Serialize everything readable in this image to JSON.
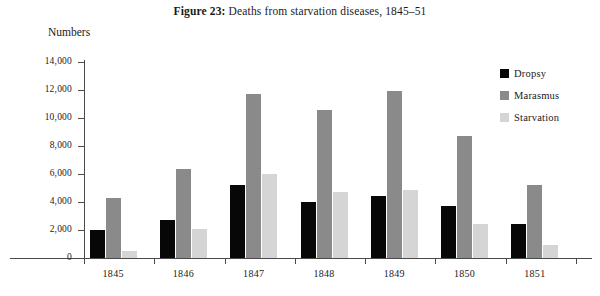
{
  "title": {
    "figure_label": "Figure 23:",
    "figure_text": "Deaths from starvation diseases, 1845–51"
  },
  "axis": {
    "y_title": "Numbers"
  },
  "legend": {
    "position": "right",
    "items": [
      {
        "label": "Dropsy",
        "color": "#070707"
      },
      {
        "label": "Marasmus",
        "color": "#8a8a8a"
      },
      {
        "label": "Starvation",
        "color": "#d5d5d5"
      }
    ]
  },
  "chart_data": {
    "type": "bar",
    "title": "Figure 23: Deaths from starvation diseases, 1845–51",
    "xlabel": "",
    "ylabel": "Numbers",
    "ylim": [
      0,
      14000
    ],
    "ytick_labels": [
      "14,000",
      "12,000",
      "10,000",
      "8,000",
      "6,000",
      "4,000",
      "2,000",
      "0"
    ],
    "ytick_values": [
      14000,
      12000,
      10000,
      8000,
      6000,
      4000,
      2000,
      0
    ],
    "grid": false,
    "categories": [
      "1845",
      "1846",
      "1847",
      "1848",
      "1849",
      "1850",
      "1851"
    ],
    "series": [
      {
        "name": "Dropsy",
        "color": "#070707",
        "values": [
          2000,
          2700,
          5200,
          4000,
          4400,
          3700,
          2450
        ]
      },
      {
        "name": "Marasmus",
        "color": "#8a8a8a",
        "values": [
          4300,
          6350,
          11700,
          10600,
          11900,
          8700,
          5250
        ]
      },
      {
        "name": "Starvation",
        "color": "#d5d5d5",
        "values": [
          500,
          2050,
          6000,
          4750,
          4850,
          2450,
          900
        ]
      }
    ]
  }
}
